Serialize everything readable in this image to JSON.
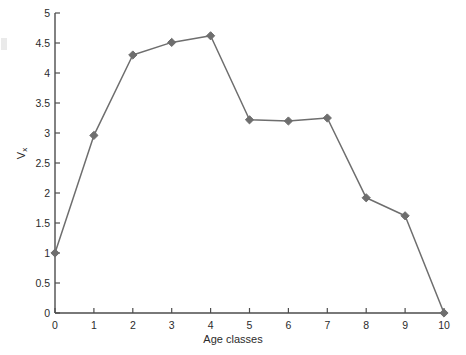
{
  "chart_data": {
    "type": "line",
    "title": "",
    "xlabel": "Age classes",
    "ylabel": "V",
    "ylabel_subscript": "x",
    "x": [
      0,
      1,
      2,
      3,
      4,
      5,
      6,
      7,
      8,
      9,
      10
    ],
    "values": [
      1.0,
      2.96,
      4.3,
      4.51,
      4.62,
      3.22,
      3.2,
      3.25,
      1.92,
      1.62,
      0.0
    ],
    "series": [
      {
        "name": "Reproductive value",
        "values": [
          1.0,
          2.96,
          4.3,
          4.51,
          4.62,
          3.22,
          3.2,
          3.25,
          1.92,
          1.62,
          0.0
        ]
      }
    ],
    "xlim": [
      0,
      10
    ],
    "ylim": [
      0,
      5
    ],
    "xticks": [
      0,
      1,
      2,
      3,
      4,
      5,
      6,
      7,
      8,
      9,
      10
    ],
    "yticks": [
      0,
      0.5,
      1,
      1.5,
      2,
      2.5,
      3,
      3.5,
      4,
      4.5,
      5
    ],
    "xtick_labels": [
      "0",
      "1",
      "2",
      "3",
      "4",
      "5",
      "6",
      "7",
      "8",
      "9",
      "10"
    ],
    "ytick_labels": [
      "0",
      "0.5",
      "1",
      "1.5",
      "2",
      "2.5",
      "3",
      "3.5",
      "4",
      "4.5",
      "5"
    ],
    "grid": false,
    "legend": false,
    "legend_position": "none",
    "marker": "diamond",
    "line_color": "#6e6e6e",
    "marker_color": "#6e6e6e",
    "axis_color": "#4d4d4d",
    "background_color": "#ffffff"
  }
}
